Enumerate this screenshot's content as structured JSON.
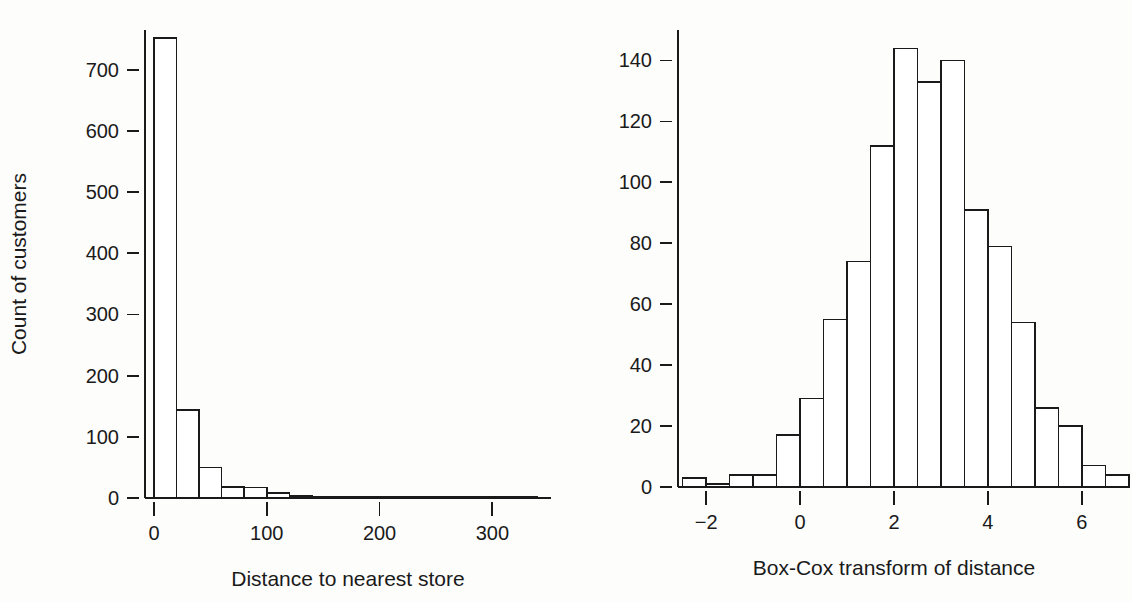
{
  "figure": {
    "background_color": "#fdfdfc",
    "ink_color": "#1a1a1a",
    "panel_count": 2
  },
  "chart_data": [
    {
      "type": "bar",
      "id": "distance-histogram",
      "title": "",
      "xlabel": "Distance to nearest store",
      "ylabel": "Count of customers",
      "xlim": [
        -8,
        352
      ],
      "ylim": [
        0,
        765
      ],
      "xticks": [
        0,
        100,
        200,
        300
      ],
      "xtick_labels": [
        "0",
        "100",
        "200",
        "300"
      ],
      "yticks": [
        0,
        100,
        200,
        300,
        400,
        500,
        600,
        700
      ],
      "ytick_labels": [
        "0",
        "100",
        "200",
        "300",
        "400",
        "500",
        "600",
        "700"
      ],
      "grid": false,
      "legend": "none",
      "bin_width": 20,
      "bin_edges": [
        0,
        20,
        40,
        60,
        80,
        100,
        120,
        140,
        160,
        180,
        200,
        220,
        240,
        260,
        280,
        300,
        320,
        340
      ],
      "values": [
        752,
        144,
        50,
        18,
        17,
        8,
        3,
        2,
        1,
        1,
        2,
        1,
        0,
        0,
        1,
        0,
        1
      ],
      "categories": [
        "0-20",
        "20-40",
        "40-60",
        "60-80",
        "80-100",
        "100-120",
        "120-140",
        "140-160",
        "160-180",
        "180-200",
        "200-220",
        "220-240",
        "240-260",
        "260-280",
        "280-300",
        "300-320",
        "320-340"
      ]
    },
    {
      "type": "bar",
      "id": "boxcox-histogram",
      "title": "",
      "xlabel": "Box-Cox transform of distance",
      "ylabel": "Count of customers",
      "xlim": [
        -2.6,
        6.6
      ],
      "ylim": [
        0,
        150
      ],
      "xticks": [
        -2,
        0,
        2,
        4,
        6
      ],
      "xtick_labels": [
        "−2",
        "0",
        "2",
        "4",
        "6"
      ],
      "yticks": [
        0,
        20,
        40,
        60,
        80,
        100,
        120,
        140
      ],
      "ytick_labels": [
        "0",
        "20",
        "40",
        "60",
        "80",
        "100",
        "120",
        "140"
      ],
      "grid": false,
      "legend": "none",
      "bin_width": 0.5,
      "bin_edges": [
        -2.5,
        -2.0,
        -1.5,
        -1.0,
        -0.5,
        0.0,
        0.5,
        1.0,
        1.5,
        2.0,
        2.5,
        3.0,
        3.5,
        4.0,
        4.5,
        5.0,
        5.5,
        6.0,
        6.5
      ],
      "values": [
        3,
        1,
        4,
        4,
        17,
        29,
        55,
        74,
        112,
        144,
        133,
        140,
        91,
        79,
        54,
        26,
        20,
        7,
        4,
        3
      ],
      "categories": [
        "-2.5--2.0",
        "-2.0--1.5",
        "-1.5--1.0",
        "-1.0--0.5",
        "-0.5-0.0",
        "0.0-0.5",
        "0.5-1.0",
        "1.0-1.5",
        "1.5-2.0",
        "2.0-2.5",
        "2.5-3.0",
        "3.0-3.5",
        "3.5-4.0",
        "4.0-4.5",
        "4.5-5.0",
        "5.0-5.5",
        "5.5-6.0",
        "6.0-6.5"
      ]
    }
  ]
}
